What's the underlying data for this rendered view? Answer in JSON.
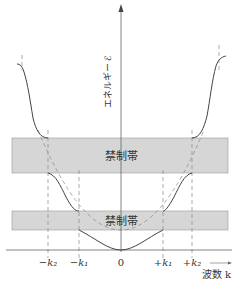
{
  "diagram": {
    "y_axis_label": "エネルギー ℰ",
    "x_axis_label": "波数 k",
    "forbidden_bands": [
      {
        "label": "禁制帯",
        "y_top": 138,
        "y_bottom": 173
      },
      {
        "label": "禁制帯",
        "y_top": 211,
        "y_bottom": 230
      }
    ],
    "x_ticks": [
      {
        "label": "−k₂",
        "x": 48
      },
      {
        "label": "−k₁",
        "x": 79
      },
      {
        "label": "0",
        "x": 121
      },
      {
        "label": "+k₁",
        "x": 163
      },
      {
        "label": "+k₂",
        "x": 192
      }
    ],
    "colors": {
      "band_fill": "#d6d6d6",
      "curve": "#444444",
      "axis": "#666666",
      "dash": "#888888"
    }
  }
}
